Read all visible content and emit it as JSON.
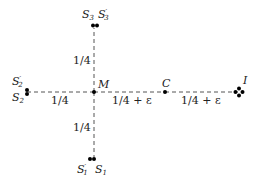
{
  "diagram": {
    "colors": {
      "line": "#555555",
      "point": "#000000",
      "text": "#222222"
    },
    "nodes": {
      "M": {
        "label": "M"
      },
      "C": {
        "label": "C"
      },
      "I": {
        "label": "I"
      },
      "S1": {
        "label": "S",
        "sub": "1"
      },
      "S1p": {
        "label": "S",
        "sub": "1",
        "prime": "′"
      },
      "S2": {
        "label": "S",
        "sub": "2"
      },
      "S2p": {
        "label": "S",
        "sub": "2",
        "prime": "′"
      },
      "S3": {
        "label": "S",
        "sub": "3"
      },
      "S3p": {
        "label": "S",
        "sub": "3",
        "prime": "′"
      }
    },
    "edges": {
      "M_top": {
        "from": "M",
        "to": "S3/S3'",
        "label": "1/4"
      },
      "M_left": {
        "from": "M",
        "to": "S2/S2'",
        "label": "1/4"
      },
      "M_bottom": {
        "from": "M",
        "to": "S1/S1'",
        "label": "1/4"
      },
      "M_C": {
        "from": "M",
        "to": "C",
        "label": "1/4 + ε"
      },
      "C_I": {
        "from": "C",
        "to": "I",
        "label": "1/4 + ε"
      }
    }
  }
}
